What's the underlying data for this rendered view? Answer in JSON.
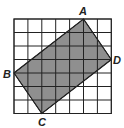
{
  "diagram": {
    "grid": {
      "cols": 7,
      "rows": 7,
      "x0": 14,
      "y0": 19,
      "cell_w": 13.9,
      "cell_h": 13.5,
      "line_color": "#222222"
    },
    "shape": {
      "fill": "#8f8f8f",
      "stroke": "#222222",
      "vertices": [
        {
          "label": "A",
          "col": 5,
          "row": 0
        },
        {
          "label": "D",
          "col": 7,
          "row": 3
        },
        {
          "label": "C",
          "col": 2,
          "row": 7
        },
        {
          "label": "B",
          "col": 0,
          "row": 4
        }
      ]
    },
    "labels": {
      "A": "A",
      "B": "B",
      "C": "C",
      "D": "D"
    }
  }
}
